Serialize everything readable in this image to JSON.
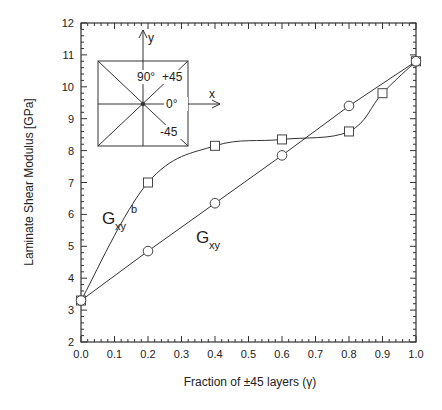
{
  "chart_data": {
    "type": "line",
    "title": "",
    "xlabel": "Fraction of ±45 layers (γ)",
    "ylabel": "Laminate Shear Modulus [GPa]",
    "xlim": [
      0.0,
      1.0
    ],
    "ylim": [
      2,
      12
    ],
    "x_ticks": [
      "0.0",
      "0.1",
      "0.2",
      "0.3",
      "0.4",
      "0.5",
      "0.6",
      "0.7",
      "0.8",
      "0.9",
      "1.0"
    ],
    "y_ticks": [
      "2",
      "3",
      "4",
      "5",
      "6",
      "7",
      "8",
      "9",
      "10",
      "11",
      "12"
    ],
    "grid": false,
    "legend": "inline labels",
    "series": [
      {
        "name": "Gxy^b",
        "label_main": "G",
        "label_sub": "xy",
        "label_sup": "b",
        "marker": "square",
        "x": [
          0.0,
          0.2,
          0.4,
          0.6,
          0.8,
          0.9,
          1.0
        ],
        "values": [
          3.3,
          7.0,
          8.15,
          8.35,
          8.6,
          9.8,
          10.8
        ],
        "line": "smooth"
      },
      {
        "name": "Gxy",
        "label_main": "G",
        "label_sub": "xy",
        "marker": "circle",
        "x": [
          0.0,
          0.2,
          0.4,
          0.6,
          0.8,
          1.0
        ],
        "values": [
          3.3,
          4.85,
          6.35,
          7.85,
          9.4,
          10.8
        ],
        "line": "straight"
      }
    ],
    "annotations": {
      "inset_axis_y": "y",
      "inset_axis_x": "x",
      "inset_90": "90°",
      "inset_plus45": "+45",
      "inset_0": "0°",
      "inset_minus45": "-45"
    }
  }
}
